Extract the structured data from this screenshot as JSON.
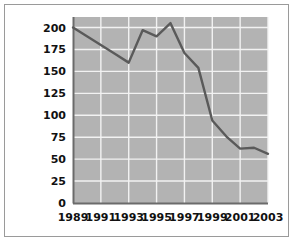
{
  "chart_data": {
    "type": "line",
    "title": "",
    "subtitle": "",
    "xlabel": "",
    "ylabel": "",
    "x": [
      1989,
      1990,
      1991,
      1992,
      1993,
      1994,
      1995,
      1996,
      1997,
      1998,
      1999,
      2000,
      2001,
      2002,
      2003
    ],
    "values": [
      200,
      190,
      180,
      170,
      160,
      197,
      190,
      205,
      171,
      154,
      94,
      76,
      62,
      63,
      56
    ],
    "series": [
      {
        "name": "series-1",
        "values": [
          200,
          190,
          180,
          170,
          160,
          197,
          190,
          205,
          171,
          154,
          94,
          76,
          62,
          63,
          56
        ]
      }
    ],
    "xlim": [
      1989,
      2003
    ],
    "ylim": [
      0,
      212
    ],
    "ytick_values": [
      0,
      25,
      50,
      75,
      100,
      125,
      150,
      175,
      200
    ],
    "ytick_labels": [
      "0",
      "25",
      "50",
      "75",
      "100",
      "125",
      "150",
      "175",
      "200"
    ],
    "xtick_values": [
      1989,
      1991,
      1993,
      1995,
      1997,
      1999,
      2001,
      2003
    ],
    "xtick_labels": [
      "1989",
      "1991",
      "1993",
      "1995",
      "1997",
      "1999",
      "2001",
      "2003"
    ],
    "grid": true,
    "grid_axis": "both",
    "legend": false,
    "legend_position": "none",
    "annotations": []
  },
  "style": {
    "page_background": "#ffffff",
    "frame_border_color": "#9a9a9a",
    "plot_background": "#b3b3b3",
    "grid_color": "#f2f2f2",
    "line_color": "#5a5a5a",
    "axis_color": "#6b6b6b",
    "tick_label_color": "#111111"
  }
}
